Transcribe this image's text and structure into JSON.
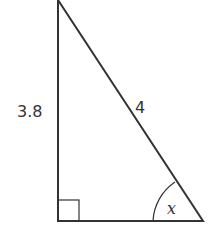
{
  "diagram": {
    "type": "right-triangle",
    "labels": {
      "vertical_side": "3.8",
      "hypotenuse": "4",
      "angle": "x"
    },
    "right_angle_marker": true,
    "colors": {
      "stroke": "#333333",
      "background": "#ffffff"
    }
  }
}
